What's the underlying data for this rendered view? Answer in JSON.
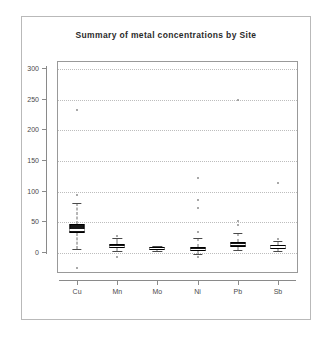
{
  "figure": {
    "title": "Summary of metal concentrations by Site",
    "background": "#ffffff",
    "frame_color": "#b9b9b9",
    "panel_border_color": "#999999",
    "grid_color": "#bdbdbd",
    "box_fill": "#171717",
    "whisker_color": "#6f6f6f",
    "outlier_color": "#8d8d8d"
  },
  "chart_data": {
    "type": "box",
    "title": "Summary of metal concentrations by Site",
    "xlabel": "",
    "ylabel": "",
    "ylim": [
      -35,
      312
    ],
    "yticks": [
      0,
      50,
      100,
      150,
      200,
      250,
      300
    ],
    "ytick_labels": [
      "0",
      "50",
      "100",
      "150",
      "200",
      "250",
      "300"
    ],
    "categories": [
      "Cu",
      "Mn",
      "Mo",
      "Ni",
      "Pb",
      "Sb"
    ],
    "grid": true,
    "grid_axis": "y",
    "grid_style": "dotted",
    "legend": "none",
    "series": [
      {
        "name": "Cu",
        "q1": 30,
        "median": 36,
        "q3": 45,
        "whisker_low": 4,
        "whisker_high": 80,
        "outliers": [
          232,
          92,
          -27
        ]
      },
      {
        "name": "Mn",
        "q1": 6,
        "median": 9,
        "q3": 13,
        "whisker_low": 1,
        "whisker_high": 22,
        "outliers": [
          26,
          -8
        ]
      },
      {
        "name": "Mo",
        "q1": 3,
        "median": 5,
        "q3": 7,
        "whisker_low": 1,
        "whisker_high": 10,
        "outliers": []
      },
      {
        "name": "Ni",
        "q1": 1,
        "median": 4,
        "q3": 8,
        "whisker_low": -4,
        "whisker_high": 22,
        "outliers": [
          120,
          85,
          72,
          32,
          -8
        ]
      },
      {
        "name": "Pb",
        "q1": 8,
        "median": 12,
        "q3": 16,
        "whisker_low": 2,
        "whisker_high": 30,
        "outliers": [
          248,
          50,
          43
        ]
      },
      {
        "name": "Sb",
        "q1": 5,
        "median": 8,
        "q3": 11,
        "whisker_low": 1,
        "whisker_high": 17,
        "outliers": [
          112,
          20
        ]
      }
    ]
  }
}
